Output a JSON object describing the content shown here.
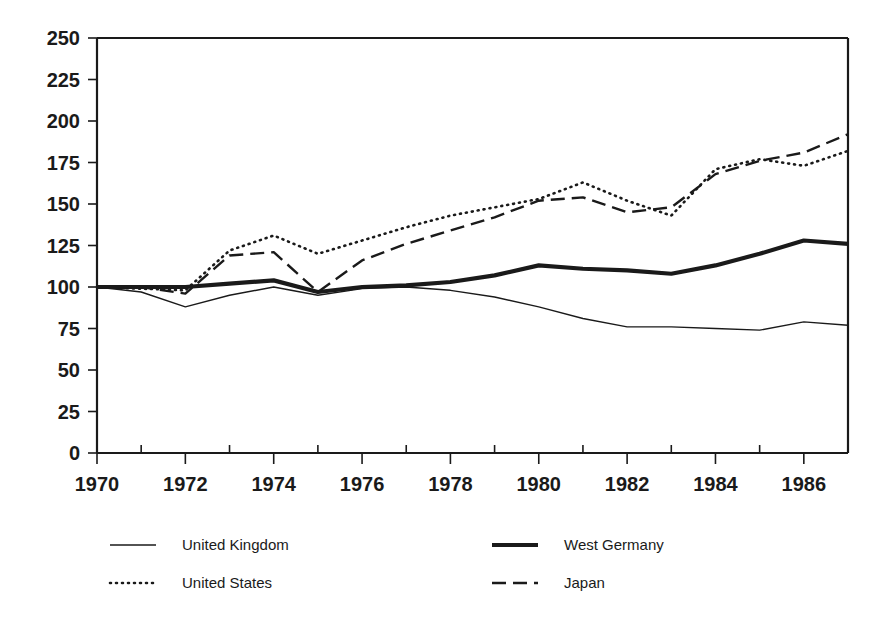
{
  "chart_data": {
    "type": "line",
    "title": "",
    "subtitle": "",
    "xlabel": "",
    "ylabel": "",
    "xlim": [
      1970,
      1987
    ],
    "ylim": [
      0,
      250
    ],
    "grid": false,
    "legend_position": "bottom",
    "x": [
      1970,
      1971,
      1972,
      1973,
      1974,
      1975,
      1976,
      1977,
      1978,
      1979,
      1980,
      1981,
      1982,
      1983,
      1984,
      1985,
      1986,
      1987
    ],
    "x_tick_labels": [
      "1970",
      "1972",
      "1974",
      "1976",
      "1978",
      "1980",
      "1982",
      "1984",
      "1986"
    ],
    "x_tick_values": [
      1970,
      1972,
      1974,
      1976,
      1978,
      1980,
      1982,
      1984,
      1986
    ],
    "x_minor_tick_values": [
      1971,
      1973,
      1975,
      1977,
      1979,
      1981,
      1983,
      1985,
      1987
    ],
    "y_tick_labels": [
      "0",
      "25",
      "50",
      "75",
      "100",
      "125",
      "150",
      "175",
      "200",
      "225",
      "250"
    ],
    "y_tick_values": [
      0,
      25,
      50,
      75,
      100,
      125,
      150,
      175,
      200,
      225,
      250
    ],
    "series": [
      {
        "name": "United Kingdom",
        "style": "solid-thin",
        "color": "#1a1a1a",
        "width": 1.4,
        "dash": "",
        "values": [
          100,
          97,
          88,
          95,
          100,
          95,
          99,
          100,
          98,
          94,
          88,
          81,
          76,
          76,
          75,
          74,
          79,
          77
        ]
      },
      {
        "name": "United States",
        "style": "dotted",
        "color": "#1a1a1a",
        "width": 2.6,
        "dash": "1,5",
        "values": [
          100,
          99,
          98,
          122,
          131,
          120,
          128,
          136,
          143,
          148,
          153,
          163,
          152,
          143,
          171,
          177,
          173,
          182
        ]
      },
      {
        "name": "West Germany",
        "style": "solid-thick",
        "color": "#1a1a1a",
        "width": 4.2,
        "dash": "",
        "values": [
          100,
          100,
          100,
          102,
          104,
          97,
          100,
          101,
          103,
          107,
          113,
          111,
          110,
          108,
          113,
          120,
          128,
          126
        ]
      },
      {
        "name": "Japan",
        "style": "dashed",
        "color": "#1a1a1a",
        "width": 2.4,
        "dash": "14,7",
        "values": [
          100,
          100,
          96,
          119,
          121,
          97,
          116,
          126,
          134,
          142,
          152,
          154,
          145,
          148,
          168,
          176,
          181,
          192
        ]
      }
    ]
  },
  "legend": {
    "entries": [
      {
        "label": "United Kingdom"
      },
      {
        "label": "West Germany"
      },
      {
        "label": "United States"
      },
      {
        "label": "Japan"
      }
    ]
  }
}
